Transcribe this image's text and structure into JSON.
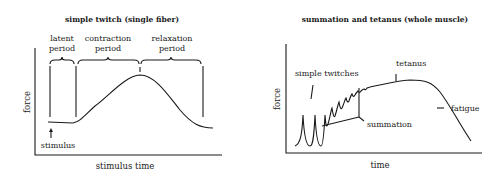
{
  "left_panel": {
    "title": "simple twitch (single fiber)",
    "y_axis_label": "force",
    "x_axis_label": "stimulus time",
    "phases": [
      {
        "line1": "latent",
        "line2": "period"
      },
      {
        "line1": "contraction",
        "line2": "period"
      },
      {
        "line1": "relaxation",
        "line2": "period"
      }
    ],
    "stimulus_label": "stimulus"
  },
  "right_panel": {
    "title": "summation and tetanus (whole muscle)",
    "y_axis_label": "force",
    "x_axis_label": "time",
    "annotations": {
      "simple_twitches": "simple twitches",
      "summation": "summation",
      "tetanus": "tetanus",
      "fatigue": "fatigue"
    }
  },
  "colors": {
    "ink": "#1a1a1a",
    "background": "#ffffff"
  }
}
